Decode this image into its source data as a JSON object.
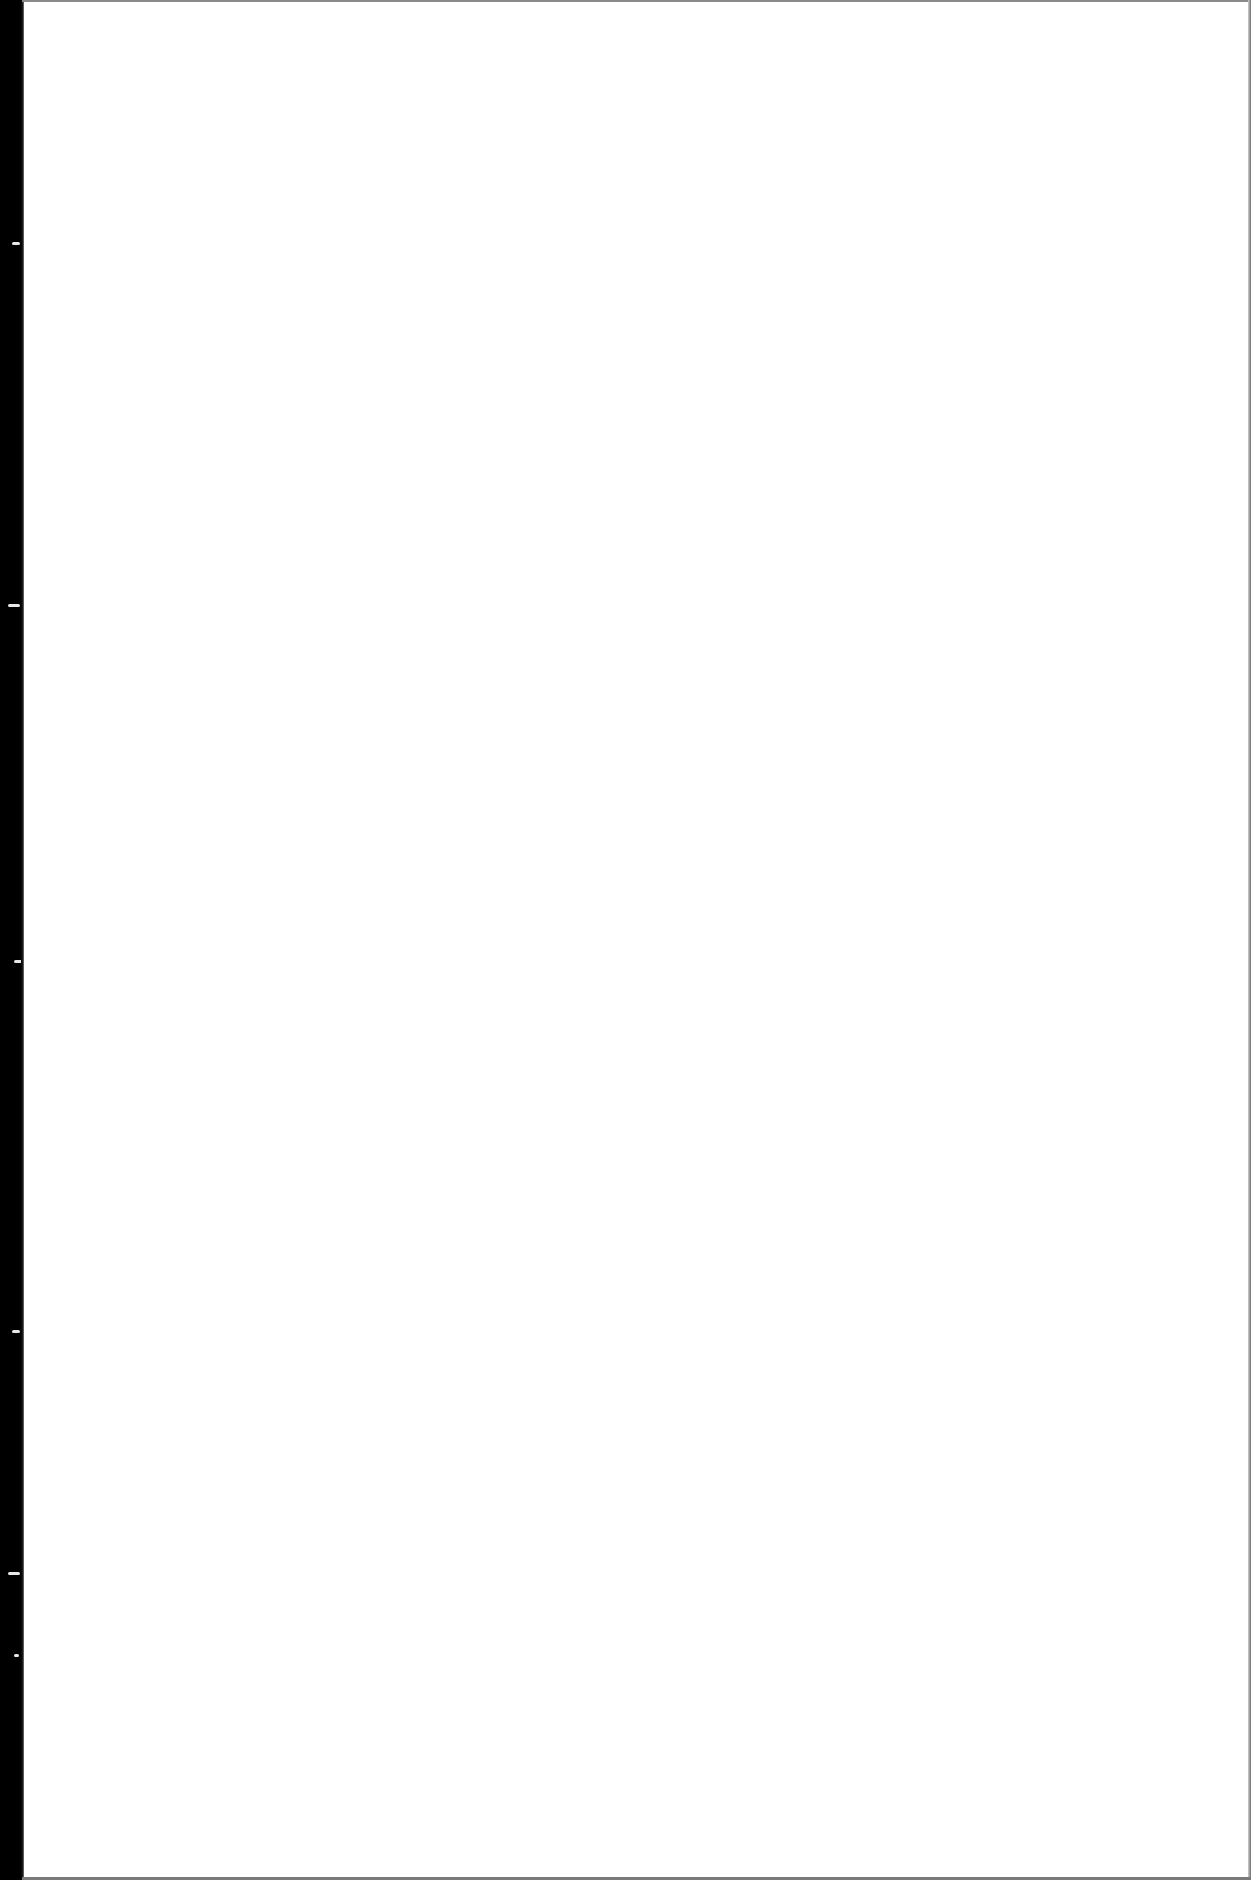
{
  "document": {
    "type": "scanned-page",
    "content": "",
    "text_blocks": [],
    "binding_edge": {
      "side": "left",
      "color": "#000000"
    },
    "page_background": "#ffffff",
    "border_color": "#8a8a8a"
  }
}
